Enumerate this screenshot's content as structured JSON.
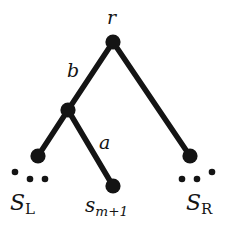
{
  "figure": {
    "type": "tree-diagram",
    "background_color": "#ffffff",
    "ink_color": "#141414",
    "width": 238,
    "height": 234
  },
  "labels": {
    "root": "r",
    "edge_upper": "b",
    "edge_lower": "a",
    "left_subtree": "S",
    "left_subtree_subscript": "L",
    "middle_leaf": "s",
    "middle_leaf_subscript": "m+1",
    "right_subtree": "S",
    "right_subtree_subscript": "R"
  },
  "nodes": [
    {
      "id": "root",
      "name": "root-node-r",
      "cx": 113,
      "cy": 42,
      "r": 7.5
    },
    {
      "id": "internal",
      "name": "internal-node",
      "cx": 68,
      "cy": 110,
      "r": 7.5
    },
    {
      "id": "leaf-left",
      "name": "left-leaf-node",
      "cx": 38,
      "cy": 156,
      "r": 7.5
    },
    {
      "id": "leaf-middle",
      "name": "middle-leaf-node",
      "cx": 113,
      "cy": 186,
      "r": 7.5
    },
    {
      "id": "leaf-right",
      "name": "right-leaf-node",
      "cx": 190,
      "cy": 156,
      "r": 7.5
    }
  ],
  "edges": [
    {
      "id": "edge-b",
      "name": "edge-root-to-internal",
      "from": "root",
      "to": "internal",
      "label": "b",
      "x1": 113,
      "y1": 42,
      "x2": 68,
      "y2": 110
    },
    {
      "id": "edge-right",
      "name": "edge-root-to-right-leaf",
      "from": "root",
      "to": "leaf-right",
      "label": "",
      "x1": 113,
      "y1": 42,
      "x2": 190,
      "y2": 156
    },
    {
      "id": "edge-left",
      "name": "edge-internal-to-left-leaf",
      "from": "internal",
      "to": "leaf-left",
      "label": "",
      "x1": 68,
      "y1": 110,
      "x2": 38,
      "y2": 156
    },
    {
      "id": "edge-a",
      "name": "edge-internal-to-middle",
      "from": "internal",
      "to": "leaf-middle",
      "label": "a",
      "x1": 68,
      "y1": 110,
      "x2": 113,
      "y2": 186
    }
  ],
  "ellipses": [
    {
      "id": "dots-left",
      "name": "left-ellipsis-dots",
      "dots": [
        {
          "cx": 15,
          "cy": 173,
          "r": 3.2
        },
        {
          "cx": 30,
          "cy": 179,
          "r": 3.2
        },
        {
          "cx": 45,
          "cy": 179,
          "r": 3.2
        }
      ]
    },
    {
      "id": "dots-right",
      "name": "right-ellipsis-dots",
      "dots": [
        {
          "cx": 182,
          "cy": 179,
          "r": 3.2
        },
        {
          "cx": 197,
          "cy": 179,
          "r": 3.2
        },
        {
          "cx": 212,
          "cy": 173,
          "r": 3.2
        }
      ]
    }
  ],
  "edge_stroke_width": 5.5
}
